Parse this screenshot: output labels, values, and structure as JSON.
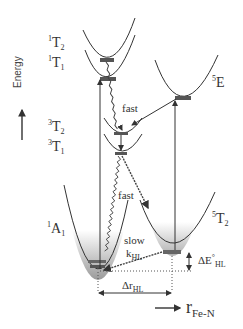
{
  "diagram": {
    "type": "potential-energy-curves",
    "y_axis_label": "Energy",
    "x_axis_label": {
      "main": "r",
      "sub": "Fe-N"
    },
    "states": [
      {
        "id": "1T2",
        "sup": "1",
        "base": "T",
        "sub": "2"
      },
      {
        "id": "1T1",
        "sup": "1",
        "base": "T",
        "sub": "1"
      },
      {
        "id": "3T2",
        "sup": "3",
        "base": "T",
        "sub": "2"
      },
      {
        "id": "3T1",
        "sup": "3",
        "base": "T",
        "sub": "1"
      },
      {
        "id": "5E",
        "sup": "5",
        "base": "E",
        "sub": ""
      },
      {
        "id": "1A1",
        "sup": "1",
        "base": "A",
        "sub": "1"
      },
      {
        "id": "5T2",
        "sup": "5",
        "base": "T",
        "sub": "2"
      }
    ],
    "annotations": {
      "fast_upper": "fast",
      "fast_lower": "fast",
      "slow": "slow",
      "k_hl": {
        "base": "k",
        "sub": "HL"
      },
      "delta_e_hl": {
        "base": "ΔE",
        "sup": "°",
        "sub": "HL"
      },
      "delta_r_hl": {
        "base": "Δr",
        "sub": "HL"
      }
    },
    "colors": {
      "line": "#333333",
      "gradient_top": "#ffffff",
      "gradient_bottom": "#9a9a9a"
    }
  }
}
